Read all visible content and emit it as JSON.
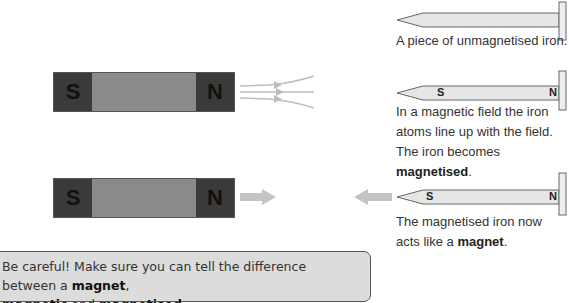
{
  "colors": {
    "pole": "#3a3a3a",
    "magnet_body": "#8a8a8a",
    "nail_fill": "#e6e6e6",
    "nail_stroke": "#666666",
    "field_arrow": "#c0c0c0",
    "callout_bg": "#dcdcdc"
  },
  "magnets": [
    {
      "south_label": "S",
      "north_label": "N"
    },
    {
      "south_label": "S",
      "north_label": "N"
    }
  ],
  "nails": [
    {
      "south_label": "",
      "north_label": "",
      "caption": "A piece of unmagnetised iron."
    },
    {
      "south_label": "S",
      "north_label": "N",
      "caption_lines": [
        "In a magnetic field the iron",
        "atoms line up with the field."
      ],
      "caption_line3_prefix": "The iron becomes ",
      "caption_line3_bold": "magnetised",
      "caption_line3_suffix": "."
    },
    {
      "south_label": "S",
      "north_label": "N",
      "caption_line1": "The magnetised iron now",
      "caption_line2_prefix": "acts like a ",
      "caption_line2_bold": "magnet",
      "caption_line2_suffix": "."
    }
  ],
  "callout": {
    "part1": "Be careful! Make sure you can tell the difference between a ",
    "bold1": "magnet",
    "part2": ",",
    "bold2": "magnetic",
    "part3": " and ",
    "bold3": "magnetised",
    "part4": "."
  }
}
